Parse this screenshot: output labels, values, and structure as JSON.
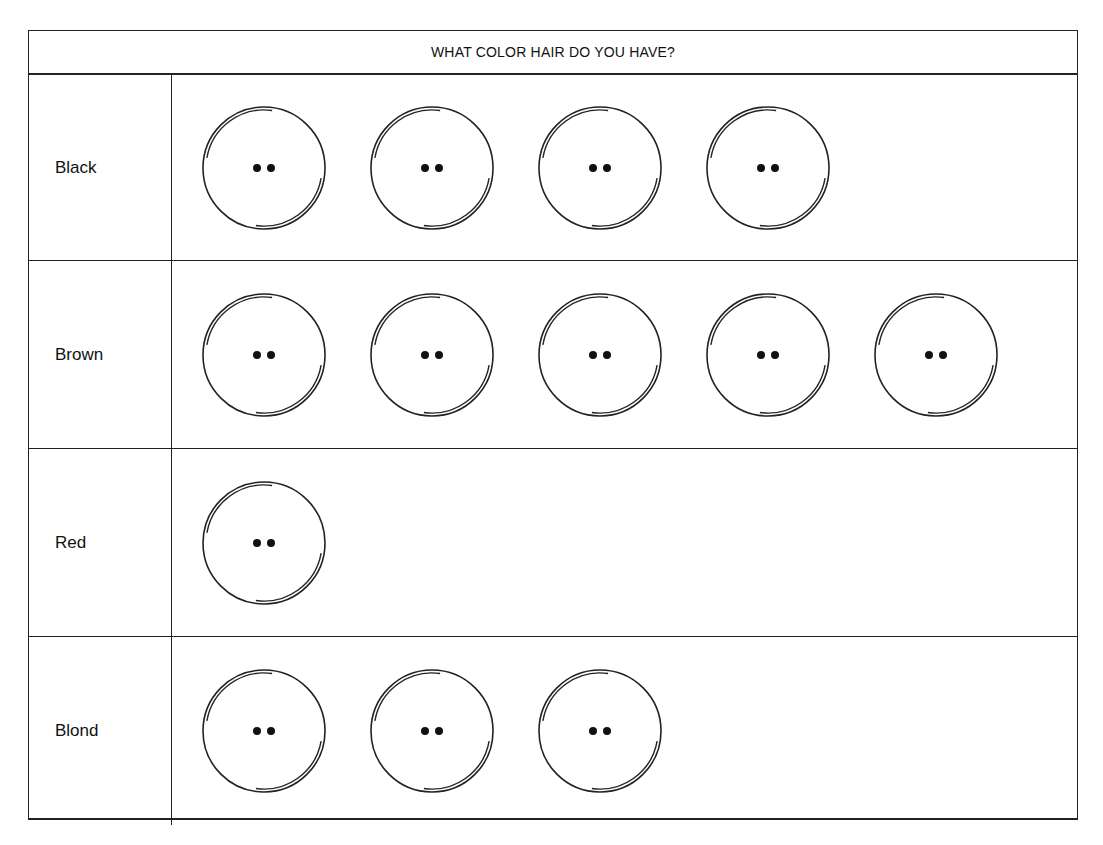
{
  "title": "WHAT COLOR HAIR DO YOU HAVE?",
  "rows": [
    {
      "label": "Black",
      "count": 4
    },
    {
      "label": "Brown",
      "count": 5
    },
    {
      "label": "Red",
      "count": 1
    },
    {
      "label": "Blond",
      "count": 3
    }
  ],
  "icon": "smiley-face-icon",
  "chart_data": {
    "type": "pictograph",
    "title": "WHAT COLOR HAIR DO YOU HAVE?",
    "categories": [
      "Black",
      "Brown",
      "Red",
      "Blond"
    ],
    "values": [
      4,
      5,
      1,
      3
    ],
    "symbol": "face (1 face = 1 person)",
    "xlabel": "",
    "ylabel": ""
  }
}
